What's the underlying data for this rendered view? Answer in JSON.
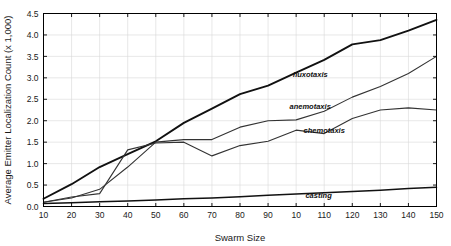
{
  "figure": {
    "background_color": "#ffffff",
    "frame_color": "#000000",
    "grid_color": "#d9d9d9"
  },
  "chart_data": {
    "type": "line",
    "title": "",
    "subtitle": "",
    "xlabel": "Swarm Size",
    "ylabel": "Average Emitter Localization Count (x 1,000)",
    "xlim": [
      10,
      150
    ],
    "ylim": [
      0.0,
      4.5
    ],
    "grid": true,
    "legend_position": "inline-annotations",
    "x": [
      10,
      20,
      30,
      40,
      50,
      60,
      70,
      80,
      90,
      100,
      110,
      120,
      130,
      140,
      150
    ],
    "xticks": [
      10,
      20,
      30,
      40,
      50,
      60,
      70,
      80,
      90,
      100,
      110,
      120,
      130,
      140,
      150
    ],
    "xtick_labels": [
      "10",
      "20",
      "30",
      "40",
      "50",
      "60",
      "70",
      "80",
      "90",
      "10",
      "110",
      "120",
      "130",
      "140",
      "150"
    ],
    "yticks": [
      0.0,
      0.5,
      1.0,
      1.5,
      2.0,
      2.5,
      3.0,
      3.5,
      4.0,
      4.5
    ],
    "ytick_labels": [
      "0.0",
      "0.5",
      "1.0",
      "1.5",
      "2.0",
      "2.5",
      "3.0",
      "3.5",
      "4.0",
      "4.5"
    ],
    "series": [
      {
        "name": "fluxotaxis",
        "color": "#111111",
        "width": 1.9,
        "label_x": 105,
        "label_y": 3.02,
        "values": [
          0.18,
          0.52,
          0.92,
          1.22,
          1.52,
          1.95,
          2.28,
          2.62,
          2.82,
          3.12,
          3.42,
          3.78,
          3.88,
          4.1,
          4.35
        ]
      },
      {
        "name": "anemotaxis",
        "color": "#333333",
        "width": 1.1,
        "label_x": 105,
        "label_y": 2.28,
        "values": [
          0.1,
          0.2,
          0.4,
          0.92,
          1.5,
          1.56,
          1.56,
          1.85,
          2.0,
          2.02,
          2.22,
          2.55,
          2.8,
          3.1,
          3.5
        ]
      },
      {
        "name": "chemotaxis",
        "color": "#333333",
        "width": 1.1,
        "label_x": 110,
        "label_y": 1.72,
        "values": [
          0.1,
          0.22,
          0.3,
          1.32,
          1.48,
          1.5,
          1.18,
          1.42,
          1.52,
          1.78,
          1.7,
          2.05,
          2.25,
          2.3,
          2.25
        ]
      },
      {
        "name": "casting",
        "color": "#111111",
        "width": 1.5,
        "label_x": 108,
        "label_y": 0.2,
        "values": [
          0.07,
          0.09,
          0.11,
          0.13,
          0.15,
          0.18,
          0.2,
          0.23,
          0.26,
          0.29,
          0.32,
          0.35,
          0.38,
          0.42,
          0.45
        ]
      }
    ]
  }
}
